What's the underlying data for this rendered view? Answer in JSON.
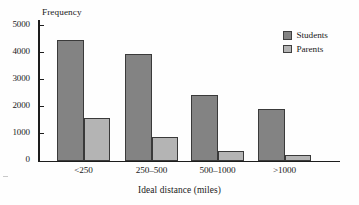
{
  "chart_data": {
    "type": "bar",
    "title": "",
    "xlabel": "Ideal distance (miles)",
    "ylabel": "Frequency",
    "categories": [
      "<250",
      "250–500",
      "500–1000",
      ">1000"
    ],
    "series": [
      {
        "name": "Students",
        "color": "#838383",
        "values": [
          4450,
          3950,
          2420,
          1900
        ]
      },
      {
        "name": "Parents",
        "color": "#b4b4b4",
        "values": [
          1560,
          880,
          360,
          200
        ]
      }
    ],
    "ylim": [
      0,
      5200
    ],
    "yticks": [
      0,
      1000,
      2000,
      3000,
      4000,
      5000
    ],
    "ytick_labels": [
      "0",
      "1000",
      "2000",
      "3000",
      "4000",
      "5000"
    ],
    "grid": false,
    "legend_position": "top-right"
  },
  "legend": {
    "items": [
      {
        "label": "Students",
        "swatch": "legend-swatch-students"
      },
      {
        "label": "Parents",
        "swatch": "legend-swatch-parents"
      }
    ]
  },
  "colors": {
    "students": "#838383",
    "parents": "#b4b4b4",
    "bar_border": "#3a3a3a",
    "axis": "#1d1d1d",
    "background": "#fefefe",
    "text": "#1a1a1a"
  }
}
